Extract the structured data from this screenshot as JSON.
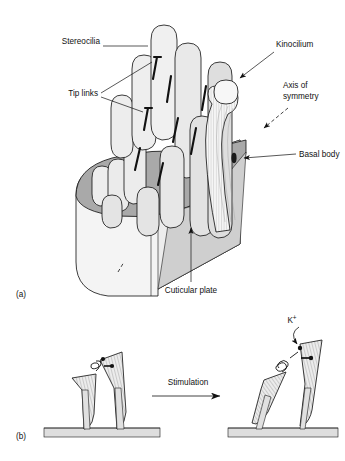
{
  "figure": {
    "panels": [
      {
        "id": "a",
        "label": "(a)",
        "caption": "Hair bundle of a hair cell"
      },
      {
        "id": "b",
        "label": "(b)",
        "caption": "Tip link stretching on stimulation"
      }
    ]
  },
  "panel_a": {
    "label": "(a)",
    "labels": {
      "stereocilia": "Stereocilia",
      "tip_links": "Tip links",
      "kinocilium": "Kinocilium",
      "axis_of_symmetry_line1": "Axis of",
      "axis_of_symmetry_line2": "symmetry",
      "basal_body": "Basal body",
      "cuticular_plate": "Cuticular plate"
    }
  },
  "panel_b": {
    "label": "(b)",
    "labels": {
      "stimulation": "Stimulation",
      "potassium": "K",
      "potassium_superscript": "+"
    }
  },
  "colors": {
    "background": "#ffffff",
    "ink": "#111111",
    "apical_surface_grey": "#a9a9a9",
    "cell_body_light": "#f2f2f2",
    "cell_body_mid": "#dcdcdc",
    "stereocilia_fill": "#ececec",
    "stereocilia_shadow": "#d2d2d2",
    "kinocilium_fill": "#f5f5f5",
    "plate_fill": "#e6e6e6",
    "hatch_line": "#9a9a9a"
  }
}
